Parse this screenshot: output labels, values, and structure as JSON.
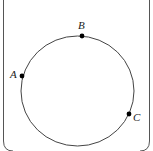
{
  "diagram": {
    "type": "circle-with-points",
    "frame": {
      "stroke": "#555555"
    },
    "circle": {
      "cx": 77.5,
      "cy": 91,
      "rx": 56.5,
      "ry": 55,
      "stroke": "#444444"
    },
    "points": [
      {
        "label": "A",
        "x": 22,
        "y": 76,
        "label_x": 10,
        "label_y": 78
      },
      {
        "label": "B",
        "x": 82,
        "y": 36,
        "label_x": 78,
        "label_y": 29
      },
      {
        "label": "C",
        "x": 129,
        "y": 114,
        "label_x": 133,
        "label_y": 121
      }
    ],
    "point_color": "#000000"
  }
}
